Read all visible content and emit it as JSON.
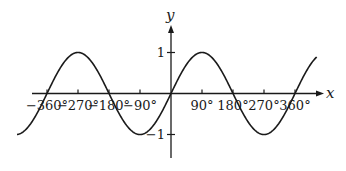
{
  "chart_data": {
    "type": "line",
    "title": "",
    "function": "y = sin x",
    "xlabel": "x",
    "ylabel": "y",
    "x_unit": "degrees",
    "xlim": [
      -447,
      424
    ],
    "ylim": [
      -1,
      1
    ],
    "x_ticks": [
      {
        "value": -360,
        "label": "−360°"
      },
      {
        "value": -270,
        "label": "−270°"
      },
      {
        "value": -180,
        "label": "−180°"
      },
      {
        "value": -90,
        "label": "−90°"
      },
      {
        "value": 90,
        "label": "90°"
      },
      {
        "value": 180,
        "label": "180°"
      },
      {
        "value": 270,
        "label": "270°"
      },
      {
        "value": 360,
        "label": "360°"
      }
    ],
    "y_ticks": [
      {
        "value": 1,
        "label": "1"
      },
      {
        "value": -1,
        "label": "−1"
      }
    ],
    "series": [
      {
        "name": "sin x",
        "x": [
          -447,
          -360,
          -270,
          -180,
          -90,
          0,
          90,
          180,
          270,
          360,
          424
        ],
        "values": [
          -0.999,
          0,
          1,
          0,
          -1,
          0,
          1,
          0,
          -1,
          0,
          0.899
        ]
      }
    ],
    "grid": false,
    "legend": "none",
    "line_color": "#1a1a1a"
  }
}
